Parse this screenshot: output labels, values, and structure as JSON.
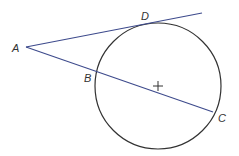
{
  "diagram": {
    "type": "circle-with-tangent-and-secant",
    "colors": {
      "background": "#ffffff",
      "circle": "#333333",
      "lines": "#3d4a8c",
      "label": "#333333"
    },
    "circle": {
      "cx": 158,
      "cy": 86,
      "r": 63
    },
    "center_mark": {
      "x": 158,
      "y": 86,
      "size": 5
    },
    "tangent_line": {
      "x1": 26,
      "y1": 47,
      "x2": 202,
      "y2": 13
    },
    "secant_line": {
      "x1": 26,
      "y1": 47,
      "x2": 213,
      "y2": 112
    },
    "points": [
      {
        "name": "A",
        "label": "A",
        "lx": 12,
        "ly": 52
      },
      {
        "name": "D",
        "label": "D",
        "lx": 141,
        "ly": 20
      },
      {
        "name": "B",
        "label": "B",
        "lx": 84,
        "ly": 82
      },
      {
        "name": "C",
        "label": "C",
        "lx": 218,
        "ly": 122
      }
    ]
  }
}
